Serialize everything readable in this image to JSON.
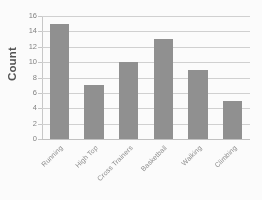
{
  "chart_data": {
    "type": "bar",
    "title": "",
    "categories": [
      "Running",
      "High Top",
      "Cross Trainers",
      "Basketball",
      "Walking",
      "Climbing"
    ],
    "values": [
      15,
      7,
      10,
      13,
      9,
      5
    ],
    "xlabel": "",
    "ylabel": "Count",
    "ylim": [
      0,
      16
    ],
    "ytick_step": 2,
    "yticks": [
      0,
      2,
      4,
      6,
      8,
      10,
      12,
      14,
      16
    ],
    "ytick_labels": [
      "0",
      "2",
      "4",
      "6",
      "8",
      "10",
      "12",
      "14",
      "16"
    ],
    "grid": "horizontal",
    "legend": "none",
    "series": [
      {
        "name": "Count",
        "values": [
          15,
          7,
          10,
          13,
          9,
          5
        ]
      }
    ],
    "colors": {
      "bar": "#8e8e8e",
      "gridline": "#d2d2d2",
      "axis": "#c8c8c8",
      "tick_label": "#808080",
      "category_label": "#8a8a8a",
      "axis_title": "#4d4d4d",
      "background": "#ffffff"
    }
  }
}
